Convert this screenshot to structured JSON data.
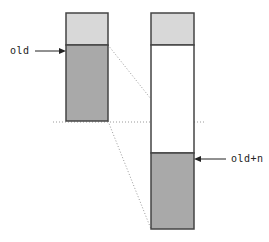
{
  "diagram": {
    "type": "memory-buffer-shift",
    "labels": {
      "old": "old",
      "old_plus_n": "old+n"
    },
    "colors": {
      "light_fill": "#d8d8d8",
      "dark_fill": "#a9a9a9",
      "empty_fill": "#ffffff",
      "stroke": "#444444",
      "dotted": "#999999"
    },
    "left_block": {
      "segments": [
        "light",
        "dark"
      ]
    },
    "right_block": {
      "segments": [
        "light",
        "empty",
        "dark"
      ]
    }
  }
}
